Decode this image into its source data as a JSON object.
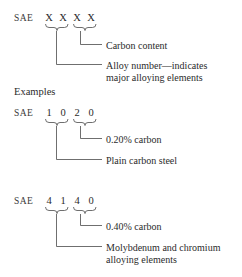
{
  "figure": {
    "examples_label": "Examples",
    "prefix": "SAE"
  },
  "blocks": [
    {
      "id": "generic",
      "prefix": "SAE",
      "code": [
        "X",
        "X",
        "X",
        "X"
      ],
      "callouts": [
        {
          "id": "carbon-content",
          "lines": [
            "Carbon content"
          ]
        },
        {
          "id": "alloy-number",
          "lines": [
            "Alloy number—indicates",
            "major alloying elements"
          ]
        }
      ]
    },
    {
      "id": "example-1020",
      "prefix": "SAE",
      "code": [
        "1",
        "0",
        "2",
        "0"
      ],
      "callouts": [
        {
          "id": "carbon-percent",
          "lines": [
            "0.20% carbon"
          ]
        },
        {
          "id": "steel-type",
          "lines": [
            "Plain carbon steel"
          ]
        }
      ]
    },
    {
      "id": "example-4140",
      "prefix": "SAE",
      "code": [
        "4",
        "1",
        "4",
        "0"
      ],
      "callouts": [
        {
          "id": "carbon-percent",
          "lines": [
            "0.40% carbon"
          ]
        },
        {
          "id": "alloy-elements",
          "lines": [
            "Molybdenum and chromium",
            "alloying elements"
          ]
        }
      ]
    }
  ],
  "style": {
    "ink": "#2b2b2b",
    "rule": "#4a4a4a",
    "background": "#ffffff"
  }
}
